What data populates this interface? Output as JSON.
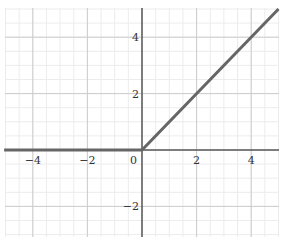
{
  "chart_data": {
    "type": "line",
    "title": "",
    "xlabel": "",
    "ylabel": "",
    "xlim": [
      -5.05,
      5.0
    ],
    "ylim": [
      -3.2,
      5.2
    ],
    "grid": true,
    "minor_grid": true,
    "legend": null,
    "x_ticks": [
      -4,
      -2,
      0,
      2,
      4
    ],
    "y_ticks": [
      -2,
      2,
      4
    ],
    "x_tick_labels": [
      "−4",
      "−2",
      "0",
      "2",
      "4"
    ],
    "y_tick_labels": [
      "−2",
      "2",
      "4"
    ],
    "series": [
      {
        "name": "y = max(0, x)",
        "color": "#666666",
        "x": [
          -5.05,
          0,
          5.0
        ],
        "y": [
          0,
          0,
          5.0
        ]
      }
    ]
  },
  "colors": {
    "background": "#ffffff",
    "major_grid": "#cccccc",
    "minor_grid": "#ececec",
    "axis": "#555555",
    "line": "#666666"
  }
}
